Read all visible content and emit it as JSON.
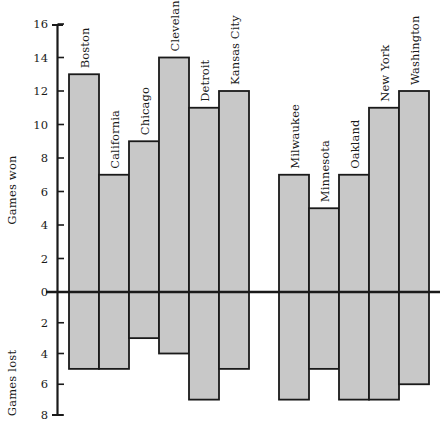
{
  "chart_data": {
    "type": "bar",
    "title": "",
    "subtitle": "",
    "xlabel": "",
    "ylabel_top": "Games won",
    "ylabel_bottom": "Games lost",
    "grid": false,
    "legend": "none",
    "orientation": "vertical",
    "note": "Diverging bar chart: bars above zero line are games won, bars below zero line are games lost (magnitudes shown as positive tick labels below axis).",
    "categories": [
      "Boston",
      "California",
      "Chicago",
      "Cleveland",
      "Detroit",
      "Kansas City",
      "Milwaukee",
      "Minnesota",
      "Oakland",
      "New York",
      "Washington"
    ],
    "series": [
      {
        "name": "Games won",
        "values": [
          13,
          7,
          9,
          14,
          11,
          12,
          7,
          5,
          7,
          11,
          12
        ]
      },
      {
        "name": "Games lost",
        "values": [
          5,
          5,
          3,
          4,
          7,
          5,
          7,
          5,
          7,
          7,
          6
        ]
      }
    ],
    "axis_top": {
      "range": [
        0,
        16
      ],
      "ticks": [
        0,
        2,
        4,
        6,
        8,
        10,
        12,
        14,
        16
      ],
      "tick_labels": [
        "0",
        "2",
        "4",
        "6",
        "8",
        "10",
        "12",
        "14",
        "16"
      ]
    },
    "axis_bottom": {
      "range": [
        0,
        8
      ],
      "ticks": [
        0,
        2,
        4,
        6,
        8
      ],
      "tick_labels": [
        "0",
        "2",
        "4",
        "6",
        "8"
      ]
    },
    "colors": {
      "bar_fill": "#c8c8c8",
      "bar_stroke": "#1a1a1a",
      "axis": "#1a1a1a",
      "background": "#ffffff",
      "text": "#1a1a1a"
    }
  }
}
